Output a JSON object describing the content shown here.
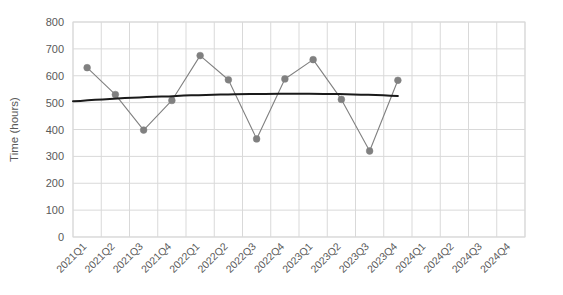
{
  "chart_data": {
    "type": "line",
    "title": "",
    "xlabel": "",
    "ylabel": "Time (hours)",
    "ylim": [
      0,
      800
    ],
    "ytick_step": 100,
    "yticks": [
      "0",
      "100",
      "200",
      "300",
      "400",
      "500",
      "600",
      "700",
      "800"
    ],
    "grid": true,
    "legend": "none",
    "categories": [
      "2021Q1",
      "2021Q2",
      "2021Q3",
      "2021Q4",
      "2022Q1",
      "2022Q2",
      "2022Q3",
      "2022Q4",
      "2023Q1",
      "2023Q2",
      "2023Q3",
      "2023Q4",
      "2024Q1",
      "2024Q2",
      "2024Q3",
      "2024Q4"
    ],
    "series": [
      {
        "name": "Time (hours)",
        "type": "line-with-markers",
        "color": "#808080",
        "marker": "circle",
        "values": [
          630,
          530,
          398,
          508,
          675,
          585,
          365,
          588,
          660,
          512,
          320,
          583,
          null,
          null,
          null,
          null
        ]
      },
      {
        "name": "Trendline (polynomial)",
        "type": "trendline",
        "color": "#1a1a1a",
        "values": [
          505,
          512,
          518,
          523,
          527,
          530,
          532,
          533,
          533,
          532,
          529,
          525,
          519,
          512,
          503,
          480
        ]
      }
    ],
    "notes": {
      "last_data_quarter": "2023Q4",
      "empty_quarters": [
        "2024Q1",
        "2024Q2",
        "2024Q3",
        "2024Q4"
      ]
    }
  },
  "axes": {
    "y_axis_title": "Time (hours)"
  },
  "colors": {
    "series_line": "#808080",
    "series_marker": "#808080",
    "trendline": "#1a1a1a",
    "gridline": "#d9d9d9",
    "plot_border": "#d9d9d9",
    "tick_text": "#595959",
    "background": "#ffffff"
  }
}
